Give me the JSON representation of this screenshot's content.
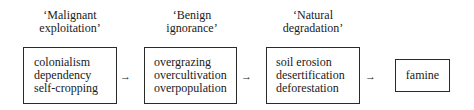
{
  "diagram": {
    "stages": [
      {
        "label_line1": "‘Malignant",
        "label_line2": "exploitation’",
        "items": [
          "colonialism",
          "dependency",
          "self-cropping"
        ]
      },
      {
        "label_line1": "‘Benign",
        "label_line2": "ignorance’",
        "items": [
          "overgrazing",
          "overcultivation",
          "overpopulation"
        ]
      },
      {
        "label_line1": "‘Natural",
        "label_line2": "degradation’",
        "items": [
          "soil erosion",
          "desertification",
          "deforestation"
        ]
      }
    ],
    "outcome": "famine",
    "arrow_glyph": "→"
  }
}
